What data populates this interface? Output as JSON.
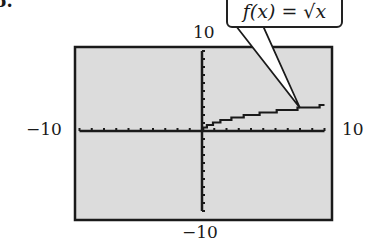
{
  "problem_number": "6.",
  "callout": {
    "text": "f(x) = √x"
  },
  "window": {
    "ymax_label": "10",
    "xmin_label": "−10",
    "xmax_label": "10",
    "ymin_label": "−10"
  },
  "colors": {
    "screen_bg": "#dcdcdc",
    "frame": "#1a1a1a",
    "curve": "#1a1a1a"
  },
  "chart_data": {
    "type": "line",
    "title": "",
    "function_label": "f(x) = √x",
    "xlabel": "",
    "ylabel": "",
    "xlim": [
      -10,
      10
    ],
    "ylim": [
      -10,
      10
    ],
    "x_tick_spacing": 1,
    "y_tick_spacing": 1,
    "grid": false,
    "series": [
      {
        "name": "f(x) = √x",
        "x": [
          0,
          0.25,
          1,
          2,
          3,
          4,
          5,
          6,
          7,
          8,
          9,
          10
        ],
        "y": [
          0,
          0.5,
          1,
          1.41,
          1.73,
          2,
          2.24,
          2.45,
          2.65,
          2.83,
          3,
          3.16
        ]
      }
    ],
    "annotations": [
      {
        "text": "f(x) = √x",
        "points_to": [
          8,
          2.83
        ]
      }
    ]
  }
}
